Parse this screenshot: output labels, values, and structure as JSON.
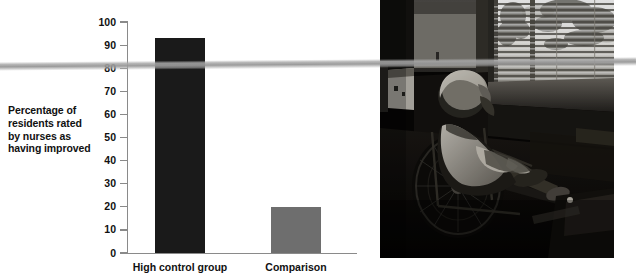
{
  "figure": {
    "background_color": "#ffffff",
    "width": 624,
    "height": 280
  },
  "chart_data": {
    "type": "bar",
    "title": "",
    "subtitle": "",
    "xlabel": "",
    "ylabel": "Percentage of residents rated by nurses as having improved",
    "ylabel_lines": [
      "Percentage of",
      "residents rated",
      "by nurses as",
      "having improved"
    ],
    "categories": [
      "High control group",
      "Comparison"
    ],
    "values": [
      93,
      20
    ],
    "series": [
      {
        "name": "Percentage of residents rated by nurses as having improved",
        "values": [
          93,
          20
        ]
      }
    ],
    "bar_colors": [
      "#1a1a1a",
      "#6e6e6e"
    ],
    "ylim": [
      0,
      100
    ],
    "ytick_labels": [
      "0",
      "10",
      "20",
      "30",
      "40",
      "50",
      "60",
      "70",
      "80",
      "90",
      "100"
    ],
    "ytick_values": [
      0,
      10,
      20,
      30,
      40,
      50,
      60,
      70,
      80,
      90,
      100
    ],
    "grid": false,
    "legend": false,
    "legend_position": "none",
    "axis_color": "#8a8a8a"
  },
  "photo": {
    "alt": "Elderly resident seated in a wheelchair facing a sunlit window with horizontal venetian blinds in a dim nursing-home room",
    "dominant_tone": "dark"
  },
  "artifact": {
    "scan_band_color": "#a8a8a8",
    "description": "pale gray scanning streak crossing the page"
  }
}
